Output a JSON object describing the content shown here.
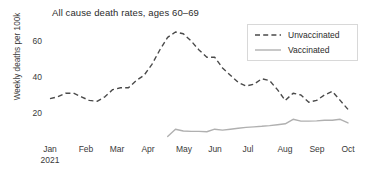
{
  "chart_data": {
    "type": "line",
    "title": "All cause death rates, ages 60–69",
    "xlabel": "",
    "ylabel": "Weekly deaths per 100k",
    "xlim": [
      0,
      40
    ],
    "ylim": [
      0,
      70
    ],
    "yticks": [
      20,
      40,
      60
    ],
    "ytick_labels": [
      "20",
      "40",
      "60"
    ],
    "xtick_labels": [
      "Jan",
      "Feb",
      "Mar",
      "Apr",
      "May",
      "Jun",
      "Jul",
      "Aug",
      "Sep",
      "Oct"
    ],
    "xtick_sublabel": "2021",
    "xtick_positions_px": [
      50,
      86,
      117,
      148,
      184,
      215,
      248,
      285,
      317,
      348
    ],
    "grid": false,
    "legend_position": "top-right",
    "series": [
      {
        "name": "Unvaccinated",
        "style": "dashed",
        "color": "#4a4a4a",
        "x": [
          1,
          2,
          3,
          4,
          5,
          6,
          7,
          8,
          9,
          10,
          11,
          12,
          13,
          14,
          15,
          16,
          17,
          18,
          19,
          20,
          21,
          22,
          23,
          24,
          25,
          26,
          27,
          28,
          29,
          30,
          31,
          32,
          33,
          34,
          35,
          36,
          37,
          38,
          39
        ],
        "values": [
          28,
          29,
          31,
          31,
          29,
          27,
          26.5,
          29,
          33,
          34,
          34,
          38,
          41,
          47,
          55,
          62,
          65,
          64,
          60,
          55,
          51,
          51,
          45,
          41,
          37,
          35,
          36,
          39,
          38,
          33,
          27,
          31,
          30,
          26,
          27,
          30,
          32,
          27,
          22
        ]
      },
      {
        "name": "Vaccinated",
        "style": "solid",
        "color": "#b0b0b0",
        "x": [
          16,
          17,
          18,
          19,
          20,
          21,
          22,
          23,
          24,
          25,
          26,
          27,
          28,
          29,
          30,
          31,
          32,
          33,
          34,
          35,
          36,
          37,
          38,
          39
        ],
        "values": [
          7,
          11,
          10,
          9.8,
          9.8,
          9.6,
          11,
          10.5,
          11,
          11.5,
          12,
          12.3,
          12.6,
          13,
          13.5,
          14,
          16.5,
          15.5,
          15.5,
          15.6,
          16,
          16,
          16.5,
          14.5
        ]
      }
    ],
    "series2_continued": {
      "name": "Unvaccinated",
      "values_tail": [
        33,
        36,
        35,
        30,
        26,
        27,
        30,
        33,
        32,
        28,
        24
      ]
    }
  },
  "legend": {
    "items": [
      {
        "label": "Unvaccinated"
      },
      {
        "label": "Vaccinated"
      }
    ]
  }
}
